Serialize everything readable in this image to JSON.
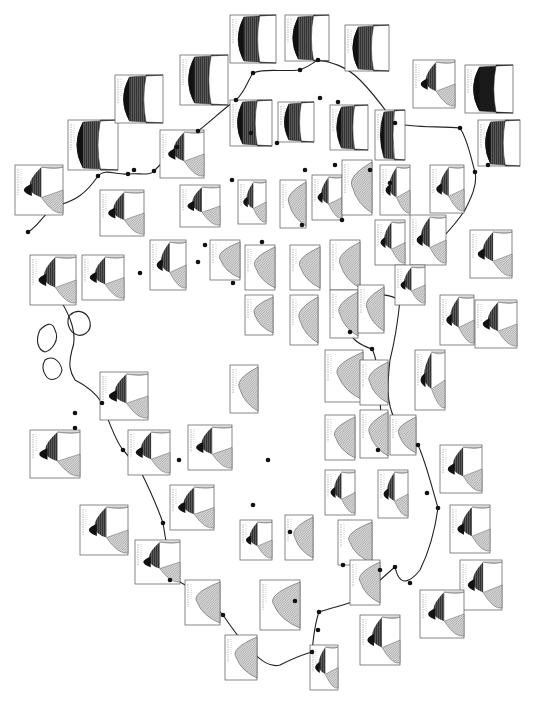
{
  "map": {
    "title": "",
    "description": "Rotated scanned map of climate diagrams (Walter-Lieth style) placed around a coastline, with station dots and leader lines. Station labels are illegible at this resolution.",
    "colors": {
      "background": "#ffffff",
      "coastline": "#222222",
      "humid_fill": "#6b6b6b",
      "perhumid_fill": "#111111",
      "arid_fill": "#c8c8c8",
      "box_border": "#555555"
    },
    "legend": {
      "perhumid": "solid black (perhumid season)",
      "humid": "dark vertical hatching (humid season)",
      "arid": "light dotted/hatched (arid season)"
    },
    "diagrams": [
      {
        "id": 1,
        "x": 30,
        "y": 255,
        "w": 46,
        "h": 50,
        "type": "humid-arid"
      },
      {
        "id": 2,
        "x": 15,
        "y": 165,
        "w": 48,
        "h": 50,
        "type": "humid-arid"
      },
      {
        "id": 3,
        "x": 82,
        "y": 255,
        "w": 42,
        "h": 45,
        "type": "humid-arid"
      },
      {
        "id": 4,
        "x": 100,
        "y": 190,
        "w": 44,
        "h": 46,
        "type": "humid-arid"
      },
      {
        "id": 5,
        "x": 68,
        "y": 120,
        "w": 50,
        "h": 50,
        "type": "humid"
      },
      {
        "id": 6,
        "x": 115,
        "y": 75,
        "w": 48,
        "h": 48,
        "type": "humid"
      },
      {
        "id": 7,
        "x": 180,
        "y": 55,
        "w": 48,
        "h": 50,
        "type": "humid"
      },
      {
        "id": 8,
        "x": 230,
        "y": 15,
        "w": 46,
        "h": 48,
        "type": "humid"
      },
      {
        "id": 9,
        "x": 285,
        "y": 15,
        "w": 44,
        "h": 46,
        "type": "humid"
      },
      {
        "id": 10,
        "x": 345,
        "y": 25,
        "w": 44,
        "h": 46,
        "type": "humid"
      },
      {
        "id": 11,
        "x": 413,
        "y": 60,
        "w": 42,
        "h": 48,
        "type": "humid-dry"
      },
      {
        "id": 12,
        "x": 465,
        "y": 65,
        "w": 48,
        "h": 48,
        "type": "perhumid"
      },
      {
        "id": 13,
        "x": 478,
        "y": 120,
        "w": 42,
        "h": 46,
        "type": "humid"
      },
      {
        "id": 14,
        "x": 160,
        "y": 130,
        "w": 44,
        "h": 48,
        "type": "humid-arid"
      },
      {
        "id": 15,
        "x": 180,
        "y": 185,
        "w": 40,
        "h": 42,
        "type": "humid-arid"
      },
      {
        "id": 16,
        "x": 230,
        "y": 100,
        "w": 42,
        "h": 46,
        "type": "humid"
      },
      {
        "id": 17,
        "x": 278,
        "y": 102,
        "w": 36,
        "h": 40,
        "type": "humid"
      },
      {
        "id": 18,
        "x": 330,
        "y": 105,
        "w": 38,
        "h": 45,
        "type": "humid"
      },
      {
        "id": 19,
        "x": 375,
        "y": 110,
        "w": 30,
        "h": 50,
        "type": "humid"
      },
      {
        "id": 20,
        "x": 430,
        "y": 165,
        "w": 34,
        "h": 48,
        "type": "humid-arid"
      },
      {
        "id": 21,
        "x": 470,
        "y": 230,
        "w": 42,
        "h": 48,
        "type": "humid-arid"
      },
      {
        "id": 22,
        "x": 475,
        "y": 300,
        "w": 42,
        "h": 48,
        "type": "humid-arid"
      },
      {
        "id": 23,
        "x": 150,
        "y": 240,
        "w": 36,
        "h": 50,
        "type": "humid-arid"
      },
      {
        "id": 24,
        "x": 210,
        "y": 240,
        "w": 30,
        "h": 40,
        "type": "arid"
      },
      {
        "id": 25,
        "x": 238,
        "y": 180,
        "w": 28,
        "h": 44,
        "type": "humid-arid"
      },
      {
        "id": 26,
        "x": 280,
        "y": 180,
        "w": 26,
        "h": 48,
        "type": "arid"
      },
      {
        "id": 27,
        "x": 312,
        "y": 175,
        "w": 30,
        "h": 45,
        "type": "humid-arid"
      },
      {
        "id": 28,
        "x": 342,
        "y": 160,
        "w": 30,
        "h": 55,
        "type": "arid"
      },
      {
        "id": 29,
        "x": 380,
        "y": 165,
        "w": 30,
        "h": 50,
        "type": "humid-arid"
      },
      {
        "id": 30,
        "x": 410,
        "y": 215,
        "w": 36,
        "h": 50,
        "type": "humid-arid"
      },
      {
        "id": 31,
        "x": 245,
        "y": 245,
        "w": 30,
        "h": 45,
        "type": "arid"
      },
      {
        "id": 32,
        "x": 290,
        "y": 245,
        "w": 30,
        "h": 45,
        "type": "arid"
      },
      {
        "id": 33,
        "x": 330,
        "y": 240,
        "w": 30,
        "h": 50,
        "type": "arid"
      },
      {
        "id": 34,
        "x": 375,
        "y": 220,
        "w": 30,
        "h": 45,
        "type": "humid-arid"
      },
      {
        "id": 35,
        "x": 395,
        "y": 265,
        "w": 30,
        "h": 40,
        "type": "humid-arid"
      },
      {
        "id": 36,
        "x": 245,
        "y": 295,
        "w": 28,
        "h": 40,
        "type": "arid"
      },
      {
        "id": 37,
        "x": 290,
        "y": 295,
        "w": 28,
        "h": 50,
        "type": "arid"
      },
      {
        "id": 38,
        "x": 330,
        "y": 290,
        "w": 28,
        "h": 48,
        "type": "arid"
      },
      {
        "id": 39,
        "x": 358,
        "y": 285,
        "w": 26,
        "h": 48,
        "type": "arid"
      },
      {
        "id": 40,
        "x": 440,
        "y": 295,
        "w": 34,
        "h": 50,
        "type": "humid-arid"
      },
      {
        "id": 41,
        "x": 100,
        "y": 372,
        "w": 48,
        "h": 48,
        "type": "humid-arid"
      },
      {
        "id": 42,
        "x": 30,
        "y": 430,
        "w": 50,
        "h": 48,
        "type": "humid-arid"
      },
      {
        "id": 43,
        "x": 128,
        "y": 430,
        "w": 42,
        "h": 45,
        "type": "humid-arid"
      },
      {
        "id": 44,
        "x": 188,
        "y": 425,
        "w": 44,
        "h": 45,
        "type": "humid-arid"
      },
      {
        "id": 45,
        "x": 230,
        "y": 365,
        "w": 28,
        "h": 48,
        "type": "arid"
      },
      {
        "id": 46,
        "x": 80,
        "y": 505,
        "w": 48,
        "h": 50,
        "type": "humid-arid"
      },
      {
        "id": 47,
        "x": 170,
        "y": 485,
        "w": 44,
        "h": 45,
        "type": "humid-arid"
      },
      {
        "id": 48,
        "x": 135,
        "y": 540,
        "w": 45,
        "h": 44,
        "type": "humid-arid"
      },
      {
        "id": 49,
        "x": 185,
        "y": 580,
        "w": 35,
        "h": 45,
        "type": "arid"
      },
      {
        "id": 50,
        "x": 225,
        "y": 635,
        "w": 32,
        "h": 45,
        "type": "arid"
      },
      {
        "id": 51,
        "x": 240,
        "y": 520,
        "w": 32,
        "h": 40,
        "type": "humid-arid"
      },
      {
        "id": 52,
        "x": 285,
        "y": 515,
        "w": 28,
        "h": 45,
        "type": "arid"
      },
      {
        "id": 53,
        "x": 325,
        "y": 350,
        "w": 38,
        "h": 52,
        "type": "arid"
      },
      {
        "id": 54,
        "x": 325,
        "y": 415,
        "w": 30,
        "h": 45,
        "type": "arid"
      },
      {
        "id": 55,
        "x": 325,
        "y": 470,
        "w": 30,
        "h": 45,
        "type": "humid-arid"
      },
      {
        "id": 56,
        "x": 360,
        "y": 360,
        "w": 28,
        "h": 45,
        "type": "arid"
      },
      {
        "id": 57,
        "x": 360,
        "y": 410,
        "w": 28,
        "h": 48,
        "type": "arid"
      },
      {
        "id": 58,
        "x": 338,
        "y": 520,
        "w": 34,
        "h": 45,
        "type": "arid"
      },
      {
        "id": 59,
        "x": 378,
        "y": 470,
        "w": 30,
        "h": 48,
        "type": "humid-arid"
      },
      {
        "id": 60,
        "x": 350,
        "y": 560,
        "w": 30,
        "h": 45,
        "type": "arid"
      },
      {
        "id": 61,
        "x": 390,
        "y": 415,
        "w": 26,
        "h": 40,
        "type": "arid"
      },
      {
        "id": 62,
        "x": 415,
        "y": 350,
        "w": 30,
        "h": 60,
        "type": "humid-arid"
      },
      {
        "id": 63,
        "x": 440,
        "y": 445,
        "w": 42,
        "h": 48,
        "type": "humid-arid"
      },
      {
        "id": 64,
        "x": 450,
        "y": 505,
        "w": 40,
        "h": 48,
        "type": "humid-arid"
      },
      {
        "id": 65,
        "x": 460,
        "y": 560,
        "w": 42,
        "h": 50,
        "type": "humid-arid"
      },
      {
        "id": 66,
        "x": 420,
        "y": 590,
        "w": 44,
        "h": 48,
        "type": "humid-arid"
      },
      {
        "id": 67,
        "x": 360,
        "y": 615,
        "w": 40,
        "h": 50,
        "type": "humid-arid"
      },
      {
        "id": 68,
        "x": 310,
        "y": 645,
        "w": 28,
        "h": 45,
        "type": "humid-arid"
      },
      {
        "id": 69,
        "x": 260,
        "y": 580,
        "w": 40,
        "h": 50,
        "type": "arid"
      }
    ],
    "stations": [
      [
        28,
        232
      ],
      [
        98,
        176
      ],
      [
        128,
        174
      ],
      [
        134,
        170
      ],
      [
        154,
        171
      ],
      [
        177,
        147
      ],
      [
        198,
        131
      ],
      [
        236,
        100
      ],
      [
        253,
        73
      ],
      [
        300,
        70
      ],
      [
        318,
        60
      ],
      [
        338,
        102
      ],
      [
        395,
        123
      ],
      [
        460,
        128
      ],
      [
        475,
        172
      ],
      [
        488,
        165
      ],
      [
        320,
        98
      ],
      [
        277,
        143
      ],
      [
        251,
        133
      ],
      [
        232,
        180
      ],
      [
        305,
        170
      ],
      [
        335,
        165
      ],
      [
        370,
        170
      ],
      [
        390,
        183
      ],
      [
        342,
        220
      ],
      [
        302,
        225
      ],
      [
        233,
        283
      ],
      [
        262,
        242
      ],
      [
        198,
        262
      ],
      [
        140,
        273
      ],
      [
        205,
        245
      ],
      [
        350,
        332
      ],
      [
        372,
        349
      ],
      [
        418,
        445
      ],
      [
        438,
        508
      ],
      [
        427,
        493
      ],
      [
        378,
        450
      ],
      [
        410,
        583
      ],
      [
        395,
        567
      ],
      [
        319,
        612
      ],
      [
        318,
        630
      ],
      [
        312,
        652
      ],
      [
        223,
        615
      ],
      [
        170,
        580
      ],
      [
        163,
        523
      ],
      [
        123,
        450
      ],
      [
        102,
        403
      ],
      [
        75,
        413
      ],
      [
        75,
        428
      ],
      [
        179,
        460
      ],
      [
        295,
        601
      ],
      [
        343,
        565
      ],
      [
        380,
        570
      ],
      [
        290,
        532
      ],
      [
        253,
        505
      ],
      [
        268,
        460
      ]
    ]
  }
}
